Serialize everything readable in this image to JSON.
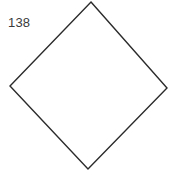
{
  "figure": {
    "number_label": "138",
    "background_color": "#ffffff",
    "label_color": "#3a3a3a",
    "stroke_color": "#2b2b2b",
    "stroke_width": 1.4,
    "fill_color": "none"
  },
  "chart_data": {
    "type": "line",
    "title": "138",
    "subtitle": "",
    "xlabel": "",
    "ylabel": "",
    "grid": false,
    "legend_position": "none",
    "axis_visible": false,
    "xlim": [
      0,
      174
    ],
    "ylim": [
      0,
      182
    ],
    "annotations": [
      {
        "name": "figure-number",
        "text": "138",
        "x": 8,
        "y": 23
      }
    ],
    "series": [
      {
        "name": "diamond-outline",
        "shape": "polygon",
        "closed": true,
        "stroke": "#2b2b2b",
        "fill": "none",
        "points": "91,2 167,88 88,169 10,86",
        "vertices": [
          {
            "label": "top",
            "x": 91,
            "y": 2
          },
          {
            "label": "right",
            "x": 167,
            "y": 88
          },
          {
            "label": "bottom",
            "x": 88,
            "y": 169
          },
          {
            "label": "left",
            "x": 10,
            "y": 86
          }
        ]
      }
    ]
  }
}
